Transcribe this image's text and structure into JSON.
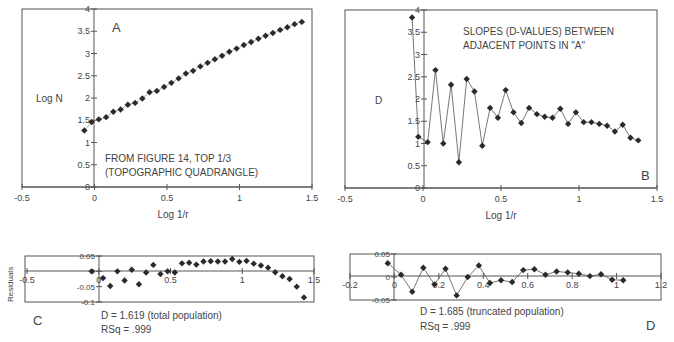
{
  "chart_data": [
    {
      "id": "A",
      "type": "scatter",
      "panel_label": "A",
      "xlabel": "Log 1/r",
      "ylabel": "Log N",
      "xlim": [
        -0.5,
        1.5
      ],
      "ylim": [
        0,
        4
      ],
      "xticks": [
        "-0.5",
        "0",
        "0.5",
        "1",
        "1.5"
      ],
      "yticks": [
        "0",
        "0.5",
        "1",
        "1.5",
        "2",
        "2.5",
        "3",
        "3.5",
        "4"
      ],
      "annotation": [
        "FROM FIGURE 14, TOP 1/3",
        "(TOPOGRAPHIC QUADRANGLE)"
      ],
      "x": [
        -0.07,
        -0.02,
        0.03,
        0.08,
        0.13,
        0.18,
        0.23,
        0.28,
        0.33,
        0.38,
        0.43,
        0.48,
        0.53,
        0.58,
        0.63,
        0.68,
        0.73,
        0.78,
        0.83,
        0.88,
        0.93,
        0.98,
        1.03,
        1.08,
        1.13,
        1.18,
        1.23,
        1.28,
        1.33,
        1.38,
        1.43
      ],
      "y": [
        1.27,
        1.46,
        1.52,
        1.57,
        1.69,
        1.74,
        1.85,
        1.89,
        1.99,
        2.13,
        2.16,
        2.25,
        2.34,
        2.44,
        2.55,
        2.61,
        2.71,
        2.79,
        2.87,
        2.95,
        3.04,
        3.11,
        3.19,
        3.26,
        3.33,
        3.4,
        3.46,
        3.53,
        3.59,
        3.66,
        3.71
      ]
    },
    {
      "id": "B",
      "type": "line",
      "panel_label": "B",
      "xlabel": "Log 1/r",
      "ylabel": "D",
      "xlim": [
        -0.5,
        1.5
      ],
      "ylim": [
        0,
        4
      ],
      "xticks": [
        "-0.5",
        "0",
        "0.5",
        "1",
        "1.5"
      ],
      "yticks": [
        "0",
        "0.5",
        "1",
        "1.5",
        "2",
        "2.5",
        "3",
        "3.5",
        "4"
      ],
      "annotation": [
        "SLOPES (D-VALUES) BETWEEN",
        "ADJACENT POINTS IN \"A\""
      ],
      "x": [
        -0.07,
        -0.03,
        0.03,
        0.08,
        0.13,
        0.18,
        0.23,
        0.28,
        0.33,
        0.38,
        0.43,
        0.48,
        0.53,
        0.58,
        0.63,
        0.68,
        0.73,
        0.78,
        0.83,
        0.88,
        0.93,
        0.98,
        1.03,
        1.08,
        1.13,
        1.18,
        1.23,
        1.28,
        1.33,
        1.38
      ],
      "y": [
        3.83,
        1.15,
        1.03,
        2.65,
        1.0,
        2.32,
        0.58,
        2.45,
        2.17,
        0.95,
        1.8,
        1.58,
        2.2,
        1.7,
        1.46,
        1.8,
        1.66,
        1.6,
        1.58,
        1.78,
        1.44,
        1.7,
        1.48,
        1.48,
        1.44,
        1.4,
        1.27,
        1.42,
        1.13,
        1.07
      ]
    },
    {
      "id": "C",
      "type": "scatter",
      "panel_label": "C",
      "ylabel": "Residuals",
      "xlim": [
        -0.5,
        1.5
      ],
      "ylim": [
        -0.1,
        0.05
      ],
      "xticks": [
        "-0.5",
        "0",
        "0.5",
        "1",
        "1.5"
      ],
      "yticks": [
        "0.05",
        "0",
        "-0.05",
        "-0.1"
      ],
      "caption": [
        "D = 1.619 (total population)",
        "RSq = .999"
      ],
      "x": [
        -0.05,
        0.03,
        0.08,
        0.13,
        0.18,
        0.23,
        0.28,
        0.33,
        0.38,
        0.43,
        0.48,
        0.53,
        0.58,
        0.63,
        0.68,
        0.73,
        0.78,
        0.83,
        0.88,
        0.93,
        0.98,
        1.03,
        1.08,
        1.13,
        1.18,
        1.23,
        1.28,
        1.33,
        1.38,
        1.43
      ],
      "y": [
        0.0,
        -0.022,
        -0.048,
        0.0,
        -0.03,
        0.005,
        -0.042,
        -0.004,
        0.021,
        -0.009,
        0.0,
        -0.004,
        0.026,
        0.028,
        0.022,
        0.032,
        0.033,
        0.032,
        0.032,
        0.04,
        0.031,
        0.034,
        0.025,
        0.019,
        0.012,
        -0.003,
        -0.016,
        -0.025,
        -0.05,
        -0.085
      ]
    },
    {
      "id": "D",
      "type": "line",
      "panel_label": "D",
      "xlim": [
        -0.2,
        1.2
      ],
      "ylim": [
        -0.05,
        0.05
      ],
      "xticks": [
        "-0.2",
        "0",
        "0.2",
        "0.4",
        "0.6",
        "0.8",
        "1",
        "1.2"
      ],
      "yticks": [
        "0.05",
        "0",
        "-0.05"
      ],
      "caption": [
        "D = 1.685 (truncated population)",
        "RSq = .999"
      ],
      "x": [
        -0.03,
        0.03,
        0.08,
        0.13,
        0.18,
        0.23,
        0.28,
        0.33,
        0.38,
        0.43,
        0.48,
        0.53,
        0.58,
        0.63,
        0.68,
        0.73,
        0.78,
        0.83,
        0.88,
        0.93,
        0.98,
        1.03
      ],
      "y": [
        0.03,
        0.005,
        -0.032,
        0.02,
        -0.016,
        0.018,
        -0.04,
        0.0,
        0.025,
        -0.013,
        -0.007,
        -0.011,
        0.015,
        0.017,
        0.005,
        0.012,
        0.01,
        0.007,
        0.002,
        0.006,
        -0.006,
        -0.007
      ]
    }
  ]
}
